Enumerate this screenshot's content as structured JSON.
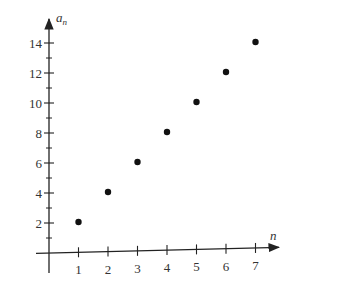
{
  "chart_data": {
    "type": "scatter",
    "title": "",
    "xlabel": "n",
    "ylabel": "a_n",
    "ylabel_base": "a",
    "ylabel_sub": "n",
    "x": [
      1,
      2,
      3,
      4,
      5,
      6,
      7
    ],
    "series": [
      {
        "name": "a_n",
        "values": [
          2,
          4,
          6,
          8,
          10,
          12,
          14
        ]
      }
    ],
    "x_ticks": [
      "1",
      "2",
      "3",
      "4",
      "5",
      "6",
      "7"
    ],
    "y_ticks": [
      "2",
      "4",
      "6",
      "8",
      "10",
      "12",
      "14"
    ],
    "y_minor_ticks": [
      1,
      3,
      5,
      7,
      9,
      11,
      13
    ],
    "xlim": [
      0,
      7.7
    ],
    "ylim": [
      0,
      15
    ],
    "grid": false,
    "legend": null,
    "colors": {
      "axis": "#333333",
      "point": "#111111"
    }
  }
}
